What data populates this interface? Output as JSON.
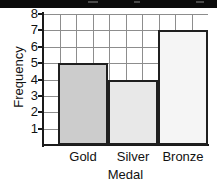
{
  "chart_data": {
    "type": "bar",
    "title": "",
    "categories": [
      "Gold",
      "Silver",
      "Bronze"
    ],
    "values": [
      5,
      4,
      7
    ],
    "xlabel": "Medal",
    "ylabel": "Frequency",
    "ylim": [
      0,
      8
    ],
    "ytick_labels": [
      "8",
      "7",
      "6",
      "5",
      "4",
      "3",
      "2",
      "1"
    ],
    "ytick_values": [
      8,
      7,
      6,
      5,
      4,
      3,
      2,
      1
    ],
    "grid": true,
    "grid_columns": 10,
    "legend": "none",
    "bar_colors": [
      "#cccccc",
      "#e8e8e8",
      "#f5f5f5"
    ],
    "bar_edge_color": "#1f1f1f",
    "grid_color": "#8d8d8d",
    "axis_color": "#1a1a1a"
  },
  "banner": {
    "color": "#0b0b0b"
  }
}
